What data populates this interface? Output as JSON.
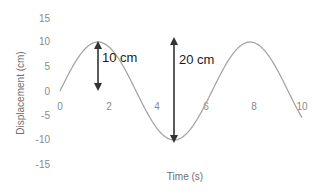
{
  "chart_data": {
    "type": "line",
    "title": "",
    "xlabel": "Time (s)",
    "ylabel": "Displacement (cm)",
    "xlim": [
      0,
      10
    ],
    "ylim": [
      -15,
      15
    ],
    "x_ticks": [
      0,
      2,
      4,
      6,
      8,
      10
    ],
    "y_ticks": [
      15,
      10,
      5,
      0,
      -5,
      -10,
      -15
    ],
    "grid": false,
    "legend": null,
    "series": [
      {
        "name": "Displacement",
        "color": "#a6a6a6",
        "function": "10*sin(t)",
        "x": [
          0,
          0.5,
          1,
          1.5,
          1.57,
          2,
          2.5,
          3,
          3.14,
          3.5,
          4,
          4.5,
          4.71,
          5,
          5.5,
          6,
          6.28,
          6.5,
          7,
          7.5,
          7.85,
          8,
          8.5,
          9,
          9.42,
          9.5,
          10
        ],
        "y": [
          0,
          4.8,
          8.4,
          10.0,
          10.0,
          9.1,
          6.0,
          1.4,
          0,
          -3.5,
          -7.6,
          -9.8,
          -10.0,
          -9.6,
          -7.1,
          -2.8,
          0,
          2.2,
          6.6,
          9.4,
          10.0,
          9.9,
          8.0,
          4.1,
          0,
          -0.8,
          -5.4
        ]
      }
    ],
    "annotations": [
      {
        "type": "double-arrow",
        "x": 1.57,
        "y_from": 10,
        "y_to": 0,
        "label": "10 cm",
        "meaning": "amplitude"
      },
      {
        "type": "double-arrow",
        "x": 4.71,
        "y_from": 10,
        "y_to": -10,
        "label": "20 cm",
        "meaning": "peak-to-trough"
      }
    ]
  },
  "labels": {
    "x_axis_title": "Time (s)",
    "y_axis_title": "Displacement (cm)",
    "annotation_1": "10 cm",
    "annotation_2": "20 cm",
    "y_ticks": [
      "15",
      "10",
      "5",
      "0",
      "-5",
      "-10",
      "-15"
    ],
    "x_ticks": [
      "0",
      "2",
      "4",
      "6",
      "8",
      "10"
    ]
  }
}
